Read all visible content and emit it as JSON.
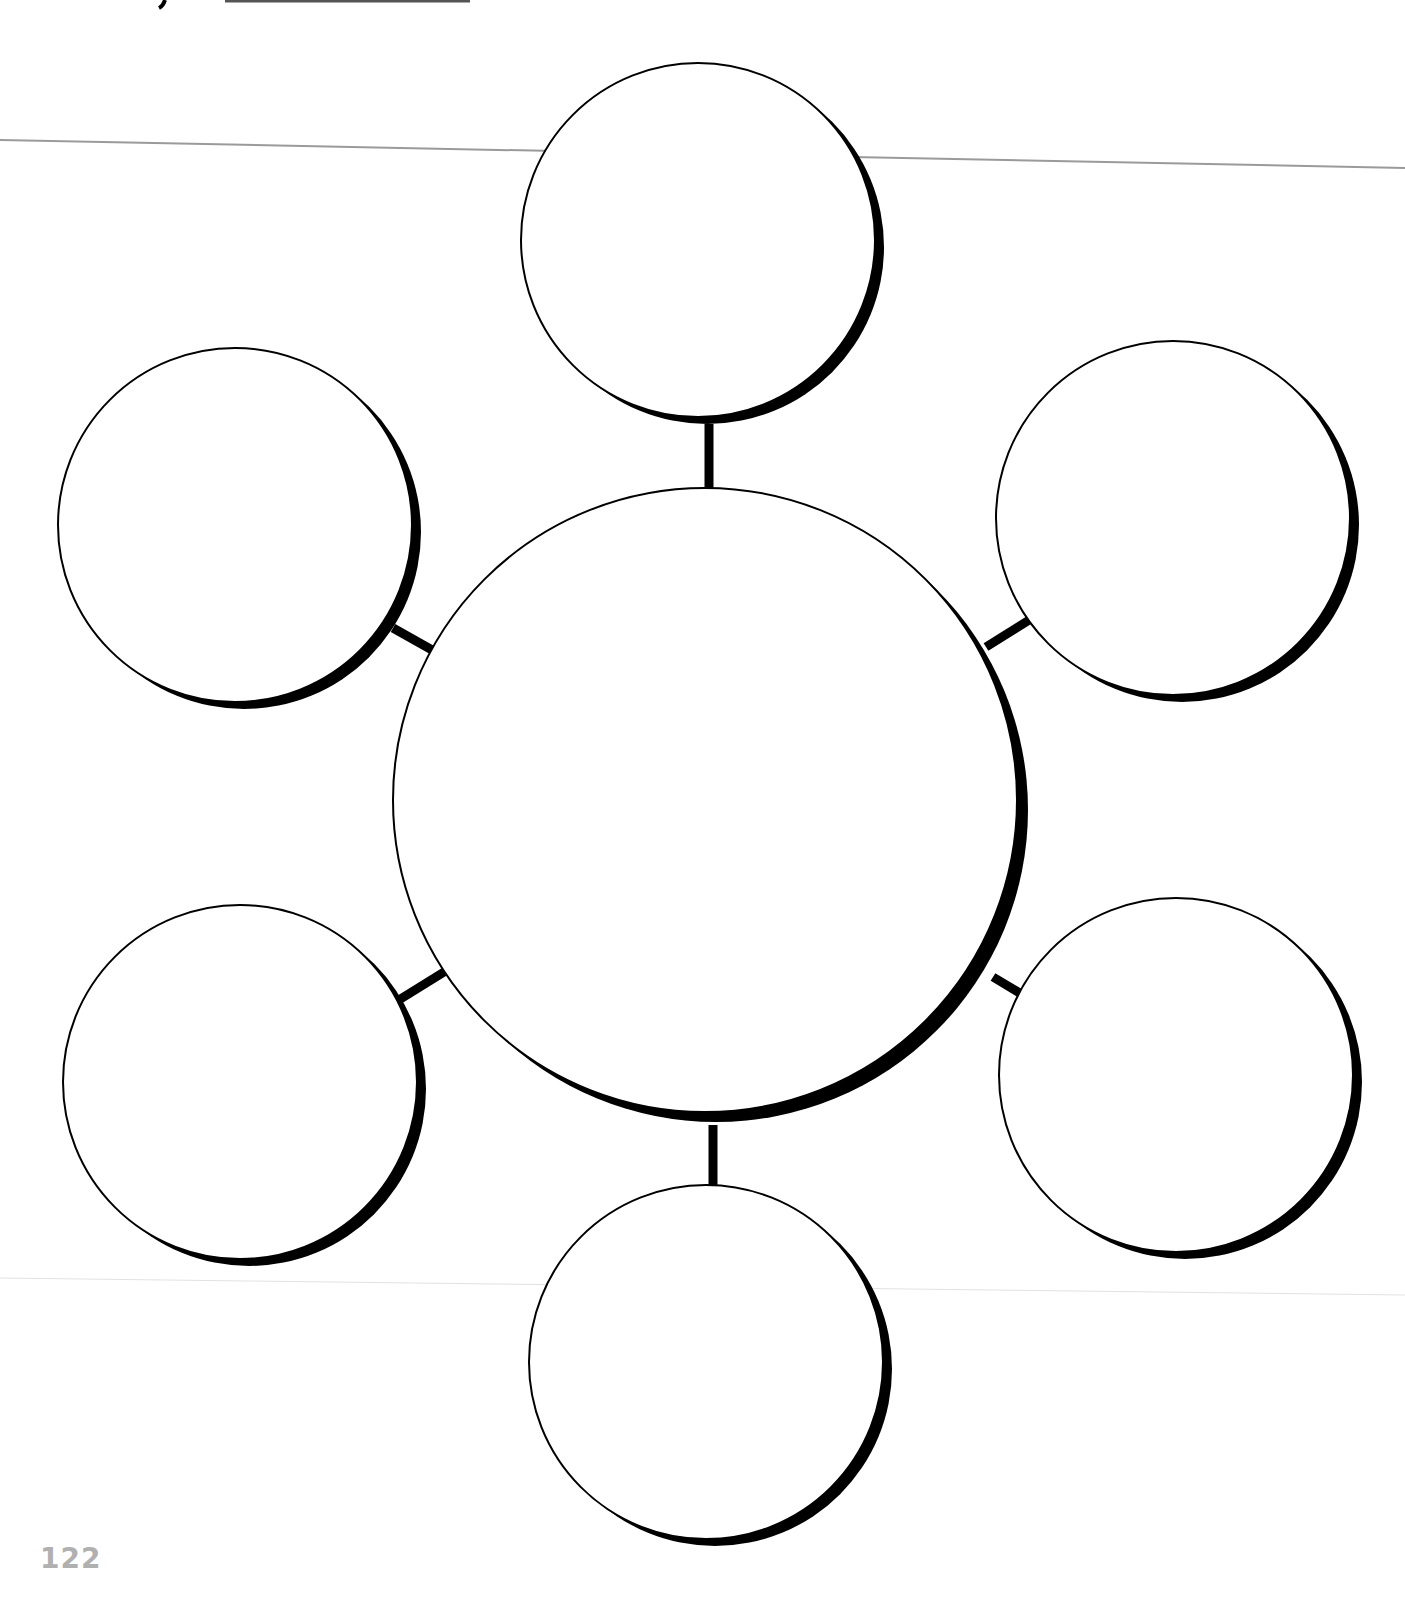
{
  "page": {
    "type": "blank-web-organizer-worksheet",
    "page_number": "122",
    "header_glyph": "y"
  },
  "diagram": {
    "center": {
      "label": "",
      "cx": 705,
      "cy": 800,
      "r": 312
    },
    "satellites": [
      {
        "id": "top",
        "label": "",
        "cx": 698,
        "cy": 240,
        "r": 177
      },
      {
        "id": "upper-left",
        "label": "",
        "cx": 235,
        "cy": 525,
        "r": 177
      },
      {
        "id": "upper-right",
        "label": "",
        "cx": 1173,
        "cy": 518,
        "r": 177
      },
      {
        "id": "lower-left",
        "label": "",
        "cx": 240,
        "cy": 1082,
        "r": 177
      },
      {
        "id": "lower-right",
        "label": "",
        "cx": 1176,
        "cy": 1075,
        "r": 177
      },
      {
        "id": "bottom",
        "label": "",
        "cx": 706,
        "cy": 1362,
        "r": 177
      }
    ],
    "colors": {
      "stroke": "#000000",
      "fill": "#ffffff",
      "guide_line": "#9a9a9a",
      "page_number": "#b0b0b0"
    }
  }
}
